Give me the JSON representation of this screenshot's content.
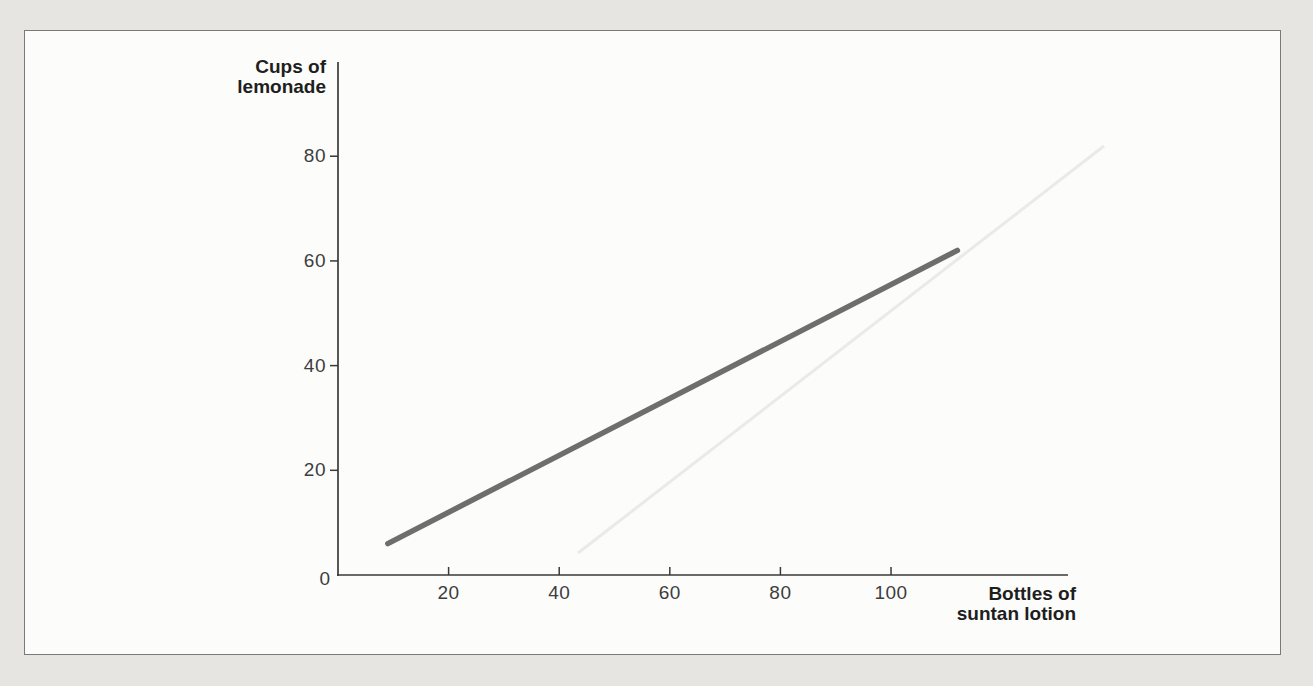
{
  "figure": {
    "background_color": "#e7e5e2",
    "paper_color": "#fcfcfb",
    "border_color": "#79797a"
  },
  "chart_data": {
    "type": "line",
    "title": "",
    "xlabel_lines": [
      "Bottles of",
      "suntan lotion"
    ],
    "ylabel_lines": [
      "Cups of",
      "lemonade"
    ],
    "origin_label": "0",
    "xlim": [
      0,
      132
    ],
    "ylim": [
      0,
      98
    ],
    "x_ticks": [
      20,
      40,
      60,
      80,
      100
    ],
    "y_ticks": [
      20,
      40,
      60,
      80
    ],
    "grid": false,
    "legend": false,
    "axis_color": "#3a3a3a",
    "tick_label_color": "#3d3d3d",
    "axis_label_color": "#1e1e1e",
    "series": [
      {
        "name": "lemonade-vs-lotion-line",
        "points": [
          [
            9,
            6
          ],
          [
            112,
            62
          ]
        ],
        "color": "#6e6e6e",
        "width": 5.5
      }
    ]
  },
  "artifacts": {
    "ghost_line": {
      "from_px": [
        578,
        553
      ],
      "to_px": [
        1104,
        146
      ],
      "color": "#e9ebe7",
      "width": 3
    }
  }
}
